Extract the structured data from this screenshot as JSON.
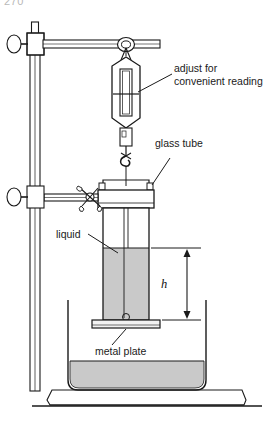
{
  "figure": {
    "page_number": "270",
    "labels": {
      "adjust": "adjust for\nconvenient reading",
      "glass_tube": "glass tube",
      "liquid": "liquid",
      "metal_plate": "metal plate",
      "height_symbol": "h"
    },
    "parts": {
      "stand_rod": "stand-rod",
      "stand_base": "stand-base",
      "upper_clamp": "upper-clamp",
      "upper_clamp_knob": "upper-clamp-knob",
      "lower_clamp": "lower-clamp",
      "lower_clamp_knob": "lower-clamp-knob",
      "horizontal_arm": "horizontal-arm",
      "support_ring": "support-ring",
      "spring_balance": "spring-balance",
      "balance_scale_window": "balance-scale-window",
      "balance_pointer": "balance-pointer",
      "hook": "hook",
      "tube_collar": "tube-collar",
      "wing_screw": "wing-screw",
      "glass_tube": "glass-tube",
      "liquid_column": "liquid-column",
      "metal_plate": "metal-plate",
      "beaker": "beaker",
      "beaker_liquid": "beaker-liquid",
      "dimension_h": "dimension-h"
    },
    "colors": {
      "outline": "#1a1a1a",
      "liquid_fill": "#c9c9c9",
      "metal_fill": "#f2f2f2",
      "white": "#ffffff",
      "page_number": "#b9b9b9"
    }
  }
}
